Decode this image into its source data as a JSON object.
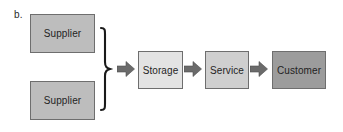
{
  "figure": {
    "label": "b.",
    "caption_colors": {
      "supplier_fill": "#bdbdbd",
      "storage_fill": "#e3e3e3",
      "service_fill": "#cfcfcf",
      "customer_fill": "#9c9c9c",
      "node_border": "#6e6e6e",
      "arrow_fill": "#6b6b6b",
      "brace_stroke": "#1a1a1a",
      "background": "#ffffff"
    }
  },
  "nodes": {
    "supplier_top": "Supplier",
    "supplier_bottom": "Supplier",
    "storage": "Storage",
    "service": "Service",
    "customer": "Customer"
  },
  "connectors": {
    "brace": "right-curly-brace",
    "arrow_1": "right-arrow",
    "arrow_2": "right-arrow",
    "arrow_3": "right-arrow"
  }
}
